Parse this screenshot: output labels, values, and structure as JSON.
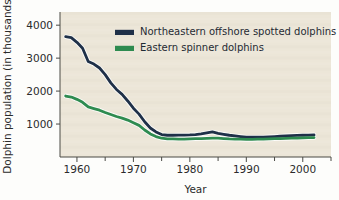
{
  "chart_data": {
    "type": "line",
    "title": "",
    "xlabel": "Year",
    "ylabel": "Dolphin population (in thousands)",
    "xlim": [
      1957,
      2005
    ],
    "ylim": [
      0,
      4400
    ],
    "grid": false,
    "legend_position": "top-center",
    "x_ticks_major": [
      1960,
      1970,
      1980,
      1990,
      2000
    ],
    "x_tick_labels": [
      "1960",
      "1970",
      "1980",
      "1990",
      "2000"
    ],
    "x_ticks_minor": [
      1965,
      1975,
      1985,
      1995,
      2005
    ],
    "y_ticks": [
      1000,
      2000,
      3000,
      4000
    ],
    "y_tick_labels": [
      "1000",
      "2000",
      "3000",
      "4000"
    ],
    "series": [
      {
        "name": "Northeastern offshore spotted dolphins",
        "color": "#1f3048",
        "x": [
          1958,
          1959,
          1960,
          1961,
          1962,
          1963,
          1964,
          1965,
          1966,
          1967,
          1968,
          1969,
          1970,
          1971,
          1972,
          1973,
          1974,
          1975,
          1976,
          1977,
          1978,
          1979,
          1980,
          1981,
          1982,
          1983,
          1984,
          1985,
          1986,
          1987,
          1988,
          1989,
          1990,
          1991,
          1992,
          1993,
          1994,
          1995,
          1996,
          1997,
          1998,
          1999,
          2000,
          2001,
          2002
        ],
        "values": [
          3650,
          3620,
          3480,
          3300,
          2900,
          2820,
          2700,
          2500,
          2250,
          2050,
          1900,
          1700,
          1480,
          1300,
          1070,
          880,
          760,
          680,
          660,
          660,
          665,
          665,
          670,
          680,
          700,
          730,
          760,
          720,
          690,
          660,
          640,
          620,
          600,
          600,
          600,
          600,
          610,
          620,
          630,
          640,
          650,
          655,
          660,
          665,
          670
        ]
      },
      {
        "name": "Eastern spinner dolphins",
        "color": "#2e8b50",
        "x": [
          1958,
          1959,
          1960,
          1961,
          1962,
          1963,
          1964,
          1965,
          1966,
          1967,
          1968,
          1969,
          1970,
          1971,
          1972,
          1973,
          1974,
          1975,
          1976,
          1977,
          1978,
          1979,
          1980,
          1981,
          1982,
          1983,
          1984,
          1985,
          1986,
          1987,
          1988,
          1989,
          1990,
          1991,
          1992,
          1993,
          1994,
          1995,
          1996,
          1997,
          1998,
          1999,
          2000,
          2001,
          2002
        ],
        "values": [
          1850,
          1820,
          1750,
          1660,
          1520,
          1470,
          1420,
          1350,
          1290,
          1230,
          1180,
          1120,
          1040,
          960,
          820,
          700,
          620,
          570,
          550,
          550,
          545,
          545,
          550,
          555,
          560,
          565,
          570,
          570,
          560,
          550,
          545,
          540,
          535,
          535,
          540,
          545,
          550,
          555,
          560,
          565,
          570,
          575,
          580,
          585,
          590
        ]
      }
    ]
  },
  "legend": {
    "items": [
      {
        "label": "Northeastern offshore spotted dolphins",
        "color": "#1f3048"
      },
      {
        "label": "Eastern spinner dolphins",
        "color": "#2e8b50"
      }
    ]
  },
  "axes": {
    "x_title": "Year",
    "y_title": "Dolphin population (in thousands)"
  },
  "colors": {
    "plot_background": "#ece6d8",
    "page_background": "#fdfdfb",
    "axis": "#4a4a45",
    "text": "#2b2b2b",
    "series_blue": "#1f3048",
    "series_green": "#2e8b50"
  }
}
